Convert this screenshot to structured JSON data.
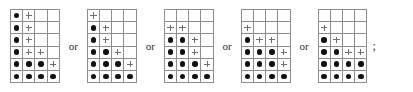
{
  "figure": {
    "name": "young-diagram-alternatives",
    "separator_label": "or",
    "terminator_label": ";",
    "markers": {
      "dot": "filled-dot",
      "plus": "plus-sign",
      "empty": "empty-cell"
    },
    "colors": {
      "dot": "#111111",
      "plus": "#6f6f6f",
      "gridline": "#8d8d8d",
      "background": "#ffffff",
      "text": "#2a2a2a"
    },
    "grid_shape": {
      "columns": 4,
      "rows": 6
    },
    "diagrams": [
      {
        "index": 1,
        "rows": [
          [
            "dot",
            "plus",
            "empty",
            "empty"
          ],
          [
            "dot",
            "plus",
            "empty",
            "empty"
          ],
          [
            "dot",
            "plus",
            "empty",
            "empty"
          ],
          [
            "dot",
            "plus",
            "plus",
            "empty"
          ],
          [
            "dot",
            "dot",
            "dot",
            "plus"
          ],
          [
            "dot",
            "dot",
            "dot",
            "dot"
          ]
        ]
      },
      {
        "index": 2,
        "rows": [
          [
            "plus",
            "empty",
            "empty",
            "empty"
          ],
          [
            "dot",
            "plus",
            "empty",
            "empty"
          ],
          [
            "dot",
            "plus",
            "empty",
            "empty"
          ],
          [
            "dot",
            "dot",
            "plus",
            "empty"
          ],
          [
            "dot",
            "dot",
            "dot",
            "plus"
          ],
          [
            "dot",
            "dot",
            "dot",
            "dot"
          ]
        ]
      },
      {
        "index": 3,
        "rows": [
          [
            "empty",
            "empty",
            "empty",
            "empty"
          ],
          [
            "plus",
            "plus",
            "empty",
            "empty"
          ],
          [
            "dot",
            "dot",
            "plus",
            "empty"
          ],
          [
            "dot",
            "dot",
            "plus",
            "empty"
          ],
          [
            "dot",
            "dot",
            "dot",
            "plus"
          ],
          [
            "dot",
            "dot",
            "dot",
            "dot"
          ]
        ]
      },
      {
        "index": 4,
        "rows": [
          [
            "empty",
            "empty",
            "empty",
            "empty"
          ],
          [
            "plus",
            "empty",
            "empty",
            "empty"
          ],
          [
            "dot",
            "plus",
            "plus",
            "empty"
          ],
          [
            "dot",
            "dot",
            "dot",
            "plus"
          ],
          [
            "dot",
            "dot",
            "dot",
            "plus"
          ],
          [
            "dot",
            "dot",
            "dot",
            "dot"
          ]
        ]
      },
      {
        "index": 5,
        "rows": [
          [
            "empty",
            "empty",
            "empty",
            "empty"
          ],
          [
            "plus",
            "empty",
            "empty",
            "empty"
          ],
          [
            "dot",
            "plus",
            "empty",
            "empty"
          ],
          [
            "dot",
            "dot",
            "plus",
            "plus"
          ],
          [
            "dot",
            "dot",
            "dot",
            "dot"
          ],
          [
            "dot",
            "dot",
            "dot",
            "dot"
          ]
        ]
      }
    ]
  }
}
